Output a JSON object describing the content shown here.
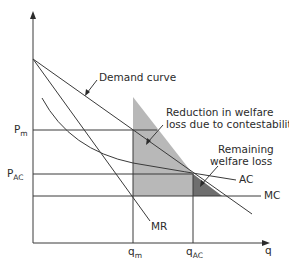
{
  "diagram": {
    "axes": {
      "y_axis_label": "",
      "x_axis_label": "q"
    },
    "price_labels": {
      "pm": {
        "main": "P",
        "sub": "m"
      },
      "pac": {
        "main": "P",
        "sub": "AC"
      }
    },
    "quantity_labels": {
      "qm": {
        "main": "q",
        "sub": "m"
      },
      "qac": {
        "main": "q",
        "sub": "AC"
      }
    },
    "curve_labels": {
      "demand": "Demand curve",
      "mr": "MR",
      "ac": "AC",
      "mc": "MC"
    },
    "annotations": {
      "reduction_line1": "Reduction in welfare",
      "reduction_line2": "loss due to contestability",
      "remaining_line1": "Remaining",
      "remaining_line2": "welfare loss"
    },
    "colors": {
      "light_shade": "#b8b8b8",
      "dark_shade": "#6e6e6e",
      "line": "#3a3a3a"
    }
  }
}
